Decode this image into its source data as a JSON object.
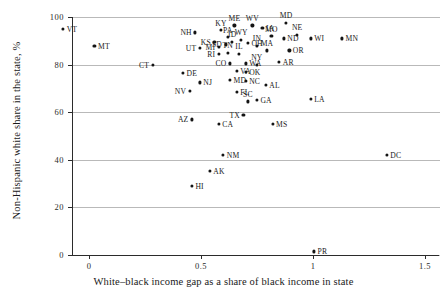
{
  "chart_data": {
    "type": "scatter",
    "title": "",
    "xlabel": "White–black income gap as a share of black income in state",
    "ylabel": "Non-Hispanic white share in the state, %",
    "xlim": [
      -0.2,
      1.5
    ],
    "ylim": [
      0,
      100
    ],
    "xticks": [
      "0",
      "0.5",
      "1",
      "1.5"
    ],
    "xtick_values": [
      0,
      0.5,
      1,
      1.5
    ],
    "yticks": [
      "0",
      "20",
      "40",
      "60",
      "80",
      "100"
    ],
    "ytick_values": [
      0,
      20,
      40,
      60,
      80,
      100
    ],
    "grid": "horizontal",
    "legend": "none",
    "point_label_field": "state",
    "points": [
      {
        "state": "VT",
        "x": -0.12,
        "y": 95,
        "pos": "r"
      },
      {
        "state": "MT",
        "x": 0.02,
        "y": 88,
        "pos": "r"
      },
      {
        "state": "CT",
        "x": 0.28,
        "y": 80,
        "pos": "l"
      },
      {
        "state": "NH",
        "x": 0.47,
        "y": 93.5,
        "pos": "l"
      },
      {
        "state": "KY",
        "x": 0.585,
        "y": 94.5,
        "pos": "t"
      },
      {
        "state": "ME",
        "x": 0.645,
        "y": 96.5,
        "pos": "t"
      },
      {
        "state": "WV",
        "x": 0.725,
        "y": 96.5,
        "pos": "t"
      },
      {
        "state": "IA",
        "x": 0.77,
        "y": 95.5,
        "pos": "r"
      },
      {
        "state": "MD2",
        "x": 0.875,
        "y": 97.5,
        "pos": "t"
      },
      {
        "state": "PA",
        "x": 0.615,
        "y": 91.5,
        "pos": "t"
      },
      {
        "state": "MO",
        "x": 0.81,
        "y": 92,
        "pos": "t"
      },
      {
        "state": "NE",
        "x": 0.925,
        "y": 92.5,
        "pos": "t"
      },
      {
        "state": "ND",
        "x": 0.865,
        "y": 91,
        "pos": "r"
      },
      {
        "state": "WI",
        "x": 0.985,
        "y": 91,
        "pos": "r"
      },
      {
        "state": "MN",
        "x": 1.125,
        "y": 91,
        "pos": "r"
      },
      {
        "state": "KS",
        "x": 0.555,
        "y": 89.5,
        "pos": "l"
      },
      {
        "state": "SD",
        "x": 0.605,
        "y": 88.5,
        "pos": "l"
      },
      {
        "state": "ID",
        "x": 0.635,
        "y": 89.5,
        "pos": "t"
      },
      {
        "state": "WY",
        "x": 0.675,
        "y": 90.5,
        "pos": "t"
      },
      {
        "state": "OH",
        "x": 0.705,
        "y": 89,
        "pos": "r"
      },
      {
        "state": "IN",
        "x": 0.745,
        "y": 88,
        "pos": "t"
      },
      {
        "state": "UT",
        "x": 0.49,
        "y": 87,
        "pos": "l"
      },
      {
        "state": "MI",
        "x": 0.575,
        "y": 87.5,
        "pos": "l"
      },
      {
        "state": "RI",
        "x": 0.575,
        "y": 84.5,
        "pos": "l"
      },
      {
        "state": "TN",
        "x": 0.615,
        "y": 85,
        "pos": "t"
      },
      {
        "state": "IL",
        "x": 0.665,
        "y": 84.5,
        "pos": "t"
      },
      {
        "state": "MA",
        "x": 0.79,
        "y": 86,
        "pos": "t"
      },
      {
        "state": "OR",
        "x": 0.89,
        "y": 86,
        "pos": "r"
      },
      {
        "state": "CO",
        "x": 0.625,
        "y": 80.5,
        "pos": "l"
      },
      {
        "state": "AR",
        "x": 0.845,
        "y": 81,
        "pos": "r"
      },
      {
        "state": "WA",
        "x": 0.695,
        "y": 80.5,
        "pos": "r"
      },
      {
        "state": "NY",
        "x": 0.745,
        "y": 80,
        "pos": "t"
      },
      {
        "state": "VA",
        "x": 0.655,
        "y": 77.5,
        "pos": "r"
      },
      {
        "state": "DE",
        "x": 0.415,
        "y": 76.5,
        "pos": "r"
      },
      {
        "state": "OK",
        "x": 0.695,
        "y": 77,
        "pos": "r"
      },
      {
        "state": "MD",
        "x": 0.625,
        "y": 73.5,
        "pos": "r"
      },
      {
        "state": "NJ",
        "x": 0.49,
        "y": 72.5,
        "pos": "r"
      },
      {
        "state": "NC",
        "x": 0.695,
        "y": 73,
        "pos": "r"
      },
      {
        "state": "AL",
        "x": 0.785,
        "y": 71.5,
        "pos": "r"
      },
      {
        "state": "NV",
        "x": 0.445,
        "y": 69,
        "pos": "l"
      },
      {
        "state": "FL",
        "x": 0.655,
        "y": 68.5,
        "pos": "r"
      },
      {
        "state": "LA",
        "x": 0.985,
        "y": 65.5,
        "pos": "r"
      },
      {
        "state": "SC",
        "x": 0.705,
        "y": 64.5,
        "pos": "t"
      },
      {
        "state": "GA",
        "x": 0.745,
        "y": 65,
        "pos": "r"
      },
      {
        "state": "AZ",
        "x": 0.455,
        "y": 57,
        "pos": "l"
      },
      {
        "state": "TX",
        "x": 0.685,
        "y": 59,
        "pos": "l"
      },
      {
        "state": "CA",
        "x": 0.575,
        "y": 55,
        "pos": "r"
      },
      {
        "state": "MS",
        "x": 0.815,
        "y": 55,
        "pos": "r"
      },
      {
        "state": "DC",
        "x": 1.325,
        "y": 42,
        "pos": "r"
      },
      {
        "state": "NM",
        "x": 0.595,
        "y": 42,
        "pos": "r"
      },
      {
        "state": "AK",
        "x": 0.535,
        "y": 35.5,
        "pos": "r"
      },
      {
        "state": "HI",
        "x": 0.455,
        "y": 29,
        "pos": "r"
      },
      {
        "state": "PR",
        "x": 1.0,
        "y": 1.5,
        "pos": "r"
      }
    ]
  }
}
